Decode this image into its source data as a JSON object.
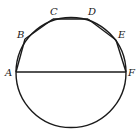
{
  "diagram": {
    "type": "geometry",
    "stroke_color": "#1a1a1a",
    "background": "#ffffff",
    "circle": {
      "cx": 71,
      "cy": 72.5,
      "r": 55
    },
    "points": [
      {
        "name": "A",
        "x": 16,
        "y": 72,
        "label_x": 5,
        "label_y": 76
      },
      {
        "name": "B",
        "x": 25,
        "y": 39,
        "label_x": 17,
        "label_y": 38
      },
      {
        "name": "C",
        "x": 53,
        "y": 19,
        "label_x": 50,
        "label_y": 15
      },
      {
        "name": "D",
        "x": 88,
        "y": 19,
        "label_x": 88,
        "label_y": 15
      },
      {
        "name": "E",
        "x": 116,
        "y": 40,
        "label_x": 118,
        "label_y": 38
      },
      {
        "name": "F",
        "x": 126,
        "y": 72,
        "label_x": 128,
        "label_y": 76
      }
    ],
    "segments": [
      "AB",
      "BC",
      "CD",
      "DE",
      "EF",
      "AF"
    ]
  }
}
